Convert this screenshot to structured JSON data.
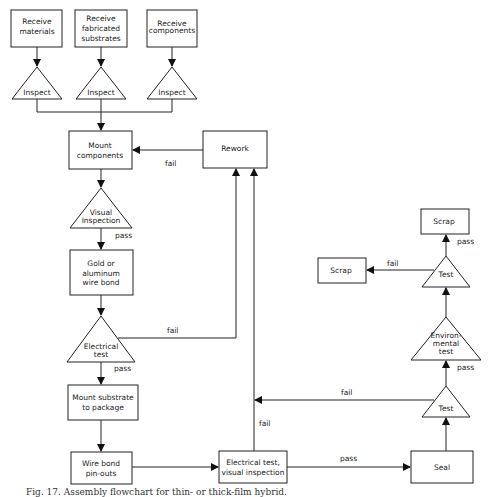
{
  "figure": {
    "caption": "Fig. 17. Assembly flowchart for thin- or thick-film hybrid."
  },
  "nodes": {
    "receive_materials": [
      "Receive",
      "materials"
    ],
    "receive_substrates": [
      "Receive",
      "fabricated",
      "substrates"
    ],
    "receive_components": [
      "Receive",
      "components"
    ],
    "inspect_1": "Inspect",
    "inspect_2": "Inspect",
    "inspect_3": "Inspect",
    "mount_components": [
      "Mount",
      "components"
    ],
    "rework": "Rework",
    "visual_inspection": [
      "Visual",
      "Inspection"
    ],
    "wire_bond": [
      "Gold or",
      "aluminum",
      "wire bond"
    ],
    "electrical_test": [
      "Electrical",
      "test"
    ],
    "mount_substrate": [
      "Mount substrate",
      "to package"
    ],
    "wire_bond_pinouts": [
      "Wire bond",
      "pin-outs"
    ],
    "electrical_visual": [
      "Electrical test,",
      "visual inspection"
    ],
    "seal": "Seal",
    "test_lower": "Test",
    "environmental_test": [
      "Environ-",
      "mental",
      "test"
    ],
    "test_upper": "Test",
    "scrap_left": "Scrap",
    "scrap_top": "Scrap"
  },
  "edge_labels": {
    "fail_mount": "fail",
    "pass_visual": "pass",
    "fail_electrical": "fail",
    "pass_electrical": "pass",
    "fail_elec_visual": "fail",
    "pass_elec_visual": "pass",
    "fail_test_lower": "fail",
    "pass_env": "pass",
    "fail_test_upper": "fail",
    "pass_test_upper": "pass"
  }
}
